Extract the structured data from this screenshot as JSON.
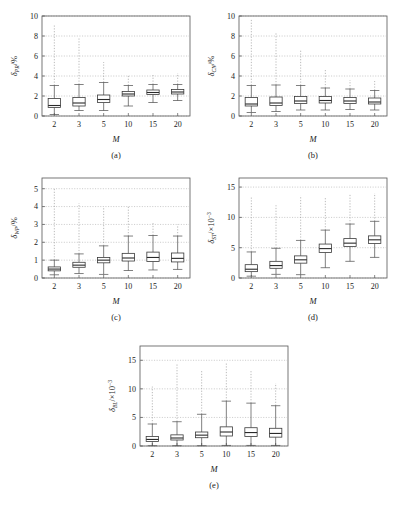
{
  "figure": {
    "background": "#ffffff",
    "line_color": "#3a3a3a",
    "grid_color": "#9a9a9a",
    "xlabel": "M",
    "panel_captions": [
      "(a)",
      "(b)",
      "(c)",
      "(d)",
      "(e)"
    ]
  },
  "chart_data": [
    {
      "type": "box",
      "panel": "(a)",
      "title": "",
      "ylabel_symbol": "δ",
      "ylabel_sub": "PR",
      "ylabel_unit": "/%",
      "xlabel": "M",
      "categories": [
        "2",
        "3",
        "5",
        "10",
        "15",
        "20"
      ],
      "ylim": [
        0,
        10
      ],
      "yticks": [
        0,
        2,
        4,
        6,
        8,
        10
      ],
      "grid": true,
      "boxes": [
        {
          "x": "2",
          "whisker_low": 0.15,
          "q1": 0.85,
          "median": 1.05,
          "q3": 1.75,
          "whisker_high": 3.05,
          "outlier_high": 9.2
        },
        {
          "x": "3",
          "whisker_low": 0.55,
          "q1": 1.0,
          "median": 1.3,
          "q3": 1.85,
          "whisker_high": 3.15,
          "outlier_high": 7.8
        },
        {
          "x": "5",
          "whisker_low": 0.55,
          "q1": 1.35,
          "median": 1.65,
          "q3": 2.1,
          "whisker_high": 3.35,
          "outlier_high": 5.4
        },
        {
          "x": "10",
          "whisker_low": 1.0,
          "q1": 2.0,
          "median": 2.2,
          "q3": 2.45,
          "whisker_high": 3.05,
          "outlier_high": 4.1
        },
        {
          "x": "15",
          "whisker_low": 1.35,
          "q1": 2.15,
          "median": 2.35,
          "q3": 2.6,
          "whisker_high": 3.15,
          "outlier_high": 4.1
        },
        {
          "x": "20",
          "whisker_low": 1.55,
          "q1": 2.2,
          "median": 2.4,
          "q3": 2.65,
          "whisker_high": 3.15,
          "outlier_high": 4.3
        }
      ]
    },
    {
      "type": "box",
      "panel": "(b)",
      "title": "",
      "ylabel_symbol": "δ",
      "ylabel_sub": "CN",
      "ylabel_unit": "/%",
      "xlabel": "M",
      "categories": [
        "2",
        "3",
        "5",
        "10",
        "15",
        "20"
      ],
      "ylim": [
        0,
        10
      ],
      "yticks": [
        0,
        2,
        4,
        6,
        8,
        10
      ],
      "grid": true,
      "boxes": [
        {
          "x": "2",
          "whisker_low": 0.35,
          "q1": 1.0,
          "median": 1.2,
          "q3": 1.85,
          "whisker_high": 3.05,
          "outlier_high": 9.7
        },
        {
          "x": "3",
          "whisker_low": 0.45,
          "q1": 1.05,
          "median": 1.3,
          "q3": 1.9,
          "whisker_high": 3.1,
          "outlier_high": 8.3
        },
        {
          "x": "5",
          "whisker_low": 0.6,
          "q1": 1.25,
          "median": 1.5,
          "q3": 1.95,
          "whisker_high": 3.05,
          "outlier_high": 6.6
        },
        {
          "x": "10",
          "whisker_low": 0.6,
          "q1": 1.3,
          "median": 1.55,
          "q3": 1.95,
          "whisker_high": 2.8,
          "outlier_high": 4.6
        },
        {
          "x": "15",
          "whisker_low": 0.65,
          "q1": 1.25,
          "median": 1.5,
          "q3": 1.85,
          "whisker_high": 2.7,
          "outlier_high": 3.6
        },
        {
          "x": "20",
          "whisker_low": 0.6,
          "q1": 1.2,
          "median": 1.4,
          "q3": 1.8,
          "whisker_high": 2.55,
          "outlier_high": 3.5
        }
      ]
    },
    {
      "type": "box",
      "panel": "(c)",
      "title": "",
      "ylabel_symbol": "δ",
      "ylabel_sub": "WP",
      "ylabel_unit": "/%",
      "xlabel": "M",
      "categories": [
        "2",
        "3",
        "5",
        "10",
        "15",
        "20"
      ],
      "ylim": [
        0,
        5.6
      ],
      "yticks": [
        0,
        1,
        2,
        3,
        4,
        5
      ],
      "grid": true,
      "boxes": [
        {
          "x": "2",
          "whisker_low": 0.18,
          "q1": 0.4,
          "median": 0.5,
          "q3": 0.62,
          "whisker_high": 1.0,
          "outlier_high": 5.0
        },
        {
          "x": "3",
          "whisker_low": 0.25,
          "q1": 0.6,
          "median": 0.72,
          "q3": 0.88,
          "whisker_high": 1.35,
          "outlier_high": 4.2
        },
        {
          "x": "5",
          "whisker_low": 0.2,
          "q1": 0.85,
          "median": 1.0,
          "q3": 1.15,
          "whisker_high": 1.8,
          "outlier_high": 4.0
        },
        {
          "x": "10",
          "whisker_low": 0.42,
          "q1": 0.95,
          "median": 1.12,
          "q3": 1.38,
          "whisker_high": 2.35,
          "outlier_high": 4.0
        },
        {
          "x": "15",
          "whisker_low": 0.45,
          "q1": 0.92,
          "median": 1.15,
          "q3": 1.45,
          "whisker_high": 2.38,
          "outlier_high": 3.1
        },
        {
          "x": "20",
          "whisker_low": 0.48,
          "q1": 0.9,
          "median": 1.1,
          "q3": 1.4,
          "whisker_high": 2.35,
          "outlier_high": 3.0
        }
      ]
    },
    {
      "type": "box",
      "panel": "(d)",
      "title": "",
      "ylabel_symbol": "δ",
      "ylabel_sub": "ST",
      "ylabel_unit": "/×10",
      "ylabel_exp": "−3",
      "xlabel": "M",
      "categories": [
        "2",
        "3",
        "5",
        "10",
        "15",
        "20"
      ],
      "ylim": [
        0,
        16.5
      ],
      "yticks": [
        0,
        5,
        10,
        15
      ],
      "grid": true,
      "boxes": [
        {
          "x": "2",
          "whisker_low": 0.3,
          "q1": 1.05,
          "median": 1.45,
          "q3": 2.2,
          "whisker_high": 4.3,
          "outlier_high": 13.5
        },
        {
          "x": "3",
          "whisker_low": 0.6,
          "q1": 1.6,
          "median": 2.05,
          "q3": 2.75,
          "whisker_high": 4.9,
          "outlier_high": 12.0
        },
        {
          "x": "5",
          "whisker_low": 0.55,
          "q1": 2.45,
          "median": 3.0,
          "q3": 3.65,
          "whisker_high": 6.2,
          "outlier_high": 13.6
        },
        {
          "x": "10",
          "whisker_low": 1.7,
          "q1": 4.2,
          "median": 4.85,
          "q3": 5.6,
          "whisker_high": 7.9,
          "outlier_high": 13.4
        },
        {
          "x": "15",
          "whisker_low": 2.75,
          "q1": 5.2,
          "median": 5.75,
          "q3": 6.5,
          "whisker_high": 8.9,
          "outlier_high": 13.8
        },
        {
          "x": "20",
          "whisker_low": 3.4,
          "q1": 5.7,
          "median": 6.3,
          "q3": 6.95,
          "whisker_high": 9.35,
          "outlier_high": 14.0
        }
      ]
    },
    {
      "type": "box",
      "panel": "(e)",
      "title": "",
      "ylabel_symbol": "δ",
      "ylabel_sub": "BL",
      "ylabel_unit": "/×10",
      "ylabel_exp": "−3",
      "xlabel": "M",
      "categories": [
        "2",
        "3",
        "5",
        "10",
        "15",
        "20"
      ],
      "ylim": [
        0,
        17.5
      ],
      "yticks": [
        0,
        5,
        10,
        15
      ],
      "grid": true,
      "boxes": [
        {
          "x": "2",
          "whisker_low": 0.05,
          "q1": 0.8,
          "median": 1.15,
          "q3": 1.65,
          "whisker_high": 3.85,
          "outlier_high": 10.4
        },
        {
          "x": "3",
          "whisker_low": 0.05,
          "q1": 1.05,
          "median": 1.4,
          "q3": 1.95,
          "whisker_high": 4.25,
          "outlier_high": 14.4
        },
        {
          "x": "5",
          "whisker_low": 0.05,
          "q1": 1.45,
          "median": 1.9,
          "q3": 2.45,
          "whisker_high": 5.55,
          "outlier_high": 13.2
        },
        {
          "x": "10",
          "whisker_low": 0.1,
          "q1": 1.75,
          "median": 2.45,
          "q3": 3.35,
          "whisker_high": 7.85,
          "outlier_high": 14.5
        },
        {
          "x": "15",
          "whisker_low": 0.1,
          "q1": 1.65,
          "median": 2.35,
          "q3": 3.2,
          "whisker_high": 7.5,
          "outlier_high": 13.3
        },
        {
          "x": "20",
          "whisker_low": 0.1,
          "q1": 1.55,
          "median": 2.2,
          "q3": 3.1,
          "whisker_high": 7.05,
          "outlier_high": 11.0
        }
      ]
    }
  ]
}
